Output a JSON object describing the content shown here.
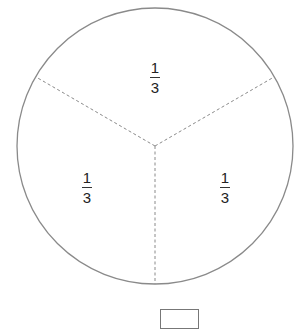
{
  "diagram": {
    "type": "circle-fraction",
    "parts": 3,
    "colors": {
      "outline": "#8a8a8a",
      "divider": "#8a8a8a",
      "text": "#222222"
    },
    "sections": [
      {
        "position": "top",
        "numerator": "1",
        "denominator": "3"
      },
      {
        "position": "bottom-left",
        "numerator": "1",
        "denominator": "3"
      },
      {
        "position": "bottom-right",
        "numerator": "1",
        "denominator": "3"
      }
    ],
    "answer_box": {
      "value": ""
    }
  }
}
